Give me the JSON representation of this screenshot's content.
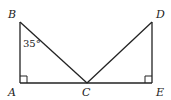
{
  "diagram": {
    "points": {
      "A": {
        "label": "A",
        "x": 20,
        "y": 83
      },
      "B": {
        "label": "B",
        "x": 20,
        "y": 22
      },
      "C": {
        "label": "C",
        "x": 87,
        "y": 83
      },
      "D": {
        "label": "D",
        "x": 152,
        "y": 22
      },
      "E": {
        "label": "E",
        "x": 152,
        "y": 83
      }
    },
    "angle_label": "35°",
    "segments": [
      "AB",
      "BC",
      "AC",
      "CE",
      "CD",
      "DE"
    ],
    "right_angles": [
      "A",
      "E"
    ],
    "stroke_color": "#222222"
  }
}
